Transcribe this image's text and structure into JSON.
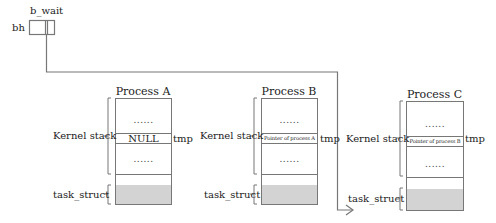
{
  "header": {
    "b_wait_label": "b_wait",
    "bh_label": "bh"
  },
  "processes": [
    {
      "title": "Process A",
      "kernel_stack_label": "Kernel stack",
      "dots_top": "......",
      "tmp_value": "NULL",
      "tmp_label": "tmp",
      "dots_bottom": "......",
      "task_struct_label": "task_struct"
    },
    {
      "title": "Process B",
      "kernel_stack_label": "Kernel stack",
      "dots_top": "......",
      "tmp_value": "Pointer of process A",
      "tmp_label": "tmp",
      "dots_bottom": "......",
      "task_struct_label": "task_struct"
    },
    {
      "title": "Process C",
      "kernel_stack_label": "Kernel stack",
      "dots_top": "......",
      "tmp_value": "Pointer of process B",
      "tmp_label": "tmp",
      "dots_bottom": "......",
      "task_struct_label": "task_struct"
    }
  ],
  "colors": {
    "line": "#777777",
    "task_struct_fill": "#d3d3d3"
  }
}
